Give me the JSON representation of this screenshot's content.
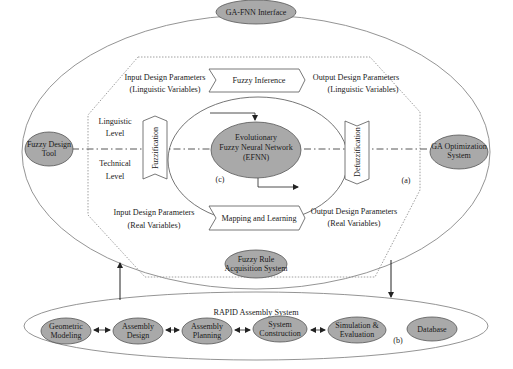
{
  "diagram": {
    "type": "system-architecture",
    "colors": {
      "node_fill": "#a9a9a9",
      "node_stroke": "#555555",
      "line": "#777777",
      "arrow": "#222222",
      "background": "#ffffff"
    },
    "top_node": {
      "label": "GA-FNN Interface"
    },
    "left_node": {
      "line1": "Fuzzy Design",
      "line2": "Tool"
    },
    "right_node": {
      "line1": "GA Optimization",
      "line2": "System"
    },
    "bottom_node": {
      "line1": "Fuzzy Rule",
      "line2": "Acquisition System"
    },
    "upper_row": {
      "input": {
        "line1": "Input Design Parameters",
        "line2": "(Linguistic Variables)"
      },
      "process": "Fuzzy Inference",
      "output": {
        "line1": "Output Design Parameters",
        "line2": "(Linguistic Variables)"
      }
    },
    "lower_row": {
      "input": {
        "line1": "Input Design Parameters",
        "line2": "(Real Variables)"
      },
      "process": "Mapping and Learning",
      "output": {
        "line1": "Output Design Parameters",
        "line2": "(Real Variables)"
      }
    },
    "levels": {
      "linguistic": {
        "line1": "Linguistic",
        "line2": "Level"
      },
      "technical": {
        "line1": "Technical",
        "line2": "Level"
      }
    },
    "fuzzification": "Fuzzification",
    "defuzzification": "Defuzzification",
    "core": {
      "line1": "Evolutionary",
      "line2": "Fuzzy Neural Network",
      "line3": "(EFNN)"
    },
    "labels": {
      "a": "(a)",
      "b": "(b)",
      "c": "(c)"
    },
    "rapid": {
      "title": "RAPID Assembly System",
      "nodes": [
        {
          "line1": "Geometric",
          "line2": "Modeling"
        },
        {
          "line1": "Assembly",
          "line2": "Design"
        },
        {
          "line1": "Assembly",
          "line2": "Planning"
        },
        {
          "line1": "System",
          "line2": "Construction"
        },
        {
          "line1": "Simulation &",
          "line2": "Evaluation"
        },
        {
          "line1": "Database",
          "line2": ""
        }
      ]
    }
  }
}
